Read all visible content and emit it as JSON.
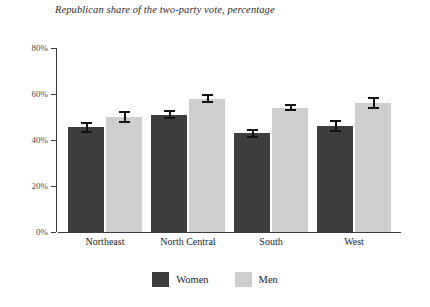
{
  "chart_data": {
    "type": "bar",
    "title": "Republican share of the two-party vote, percentage",
    "xlabel": "",
    "ylabel": "",
    "ylim": [
      0,
      80
    ],
    "yticks": [
      0,
      20,
      40,
      60,
      80
    ],
    "ytick_labels": [
      "0%",
      "20%",
      "40%",
      "60%",
      "80%"
    ],
    "grid": false,
    "legend_position": "bottom-center",
    "categories": [
      "Northeast",
      "North Central",
      "South",
      "West"
    ],
    "series": [
      {
        "name": "Women",
        "color": "#3d3d3d",
        "values": [
          45.5,
          51.0,
          43.0,
          46.0
        ],
        "errors": [
          2.5,
          2.0,
          2.0,
          2.5
        ]
      },
      {
        "name": "Men",
        "color": "#cecece",
        "values": [
          50.0,
          58.0,
          54.0,
          56.0
        ],
        "errors": [
          2.5,
          2.0,
          1.5,
          2.5
        ]
      }
    ]
  },
  "axis": {
    "tick_labels": [
      "80%",
      "60%",
      "40%",
      "20%",
      "0%"
    ]
  },
  "legend": {
    "items": [
      {
        "label": "Women"
      },
      {
        "label": "Men"
      }
    ]
  }
}
